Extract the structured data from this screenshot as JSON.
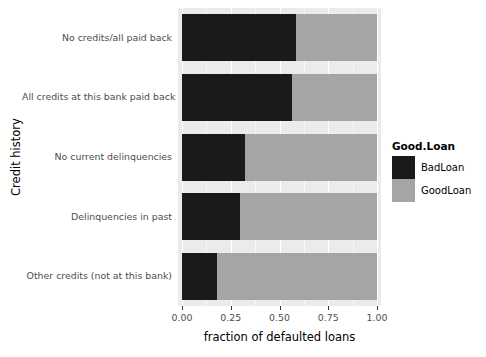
{
  "chart_data": {
    "type": "bar",
    "orientation": "horizontal",
    "stacked": true,
    "title": "",
    "xlabel": "fraction of defaulted loans",
    "ylabel": "Credit history",
    "xlim": [
      0.0,
      1.0
    ],
    "xticks": [
      "0.00",
      "0.25",
      "0.50",
      "0.75",
      "1.00"
    ],
    "xtick_values": [
      0.0,
      0.25,
      0.5,
      0.75,
      1.0
    ],
    "grid": true,
    "grid_color": "#ffffff",
    "panel_background": "#ebebeb",
    "legend_position": "right",
    "categories": [
      "No credits/all paid back",
      "All credits at this bank paid back",
      "No current delinquencies",
      "Delinquencies in past",
      "Other credits (not at this bank)"
    ],
    "series": [
      {
        "name": "BadLoan",
        "color": "#1a1a1a",
        "values": [
          0.585,
          0.565,
          0.323,
          0.298,
          0.18
        ]
      },
      {
        "name": "GoodLoan",
        "color": "#a5a5a5",
        "values": [
          0.415,
          0.435,
          0.677,
          0.702,
          0.82
        ]
      }
    ]
  },
  "legend": {
    "title": "Good.Loan",
    "entries": [
      {
        "label": "BadLoan",
        "color": "#1a1a1a"
      },
      {
        "label": "GoodLoan",
        "color": "#a5a5a5"
      }
    ]
  }
}
